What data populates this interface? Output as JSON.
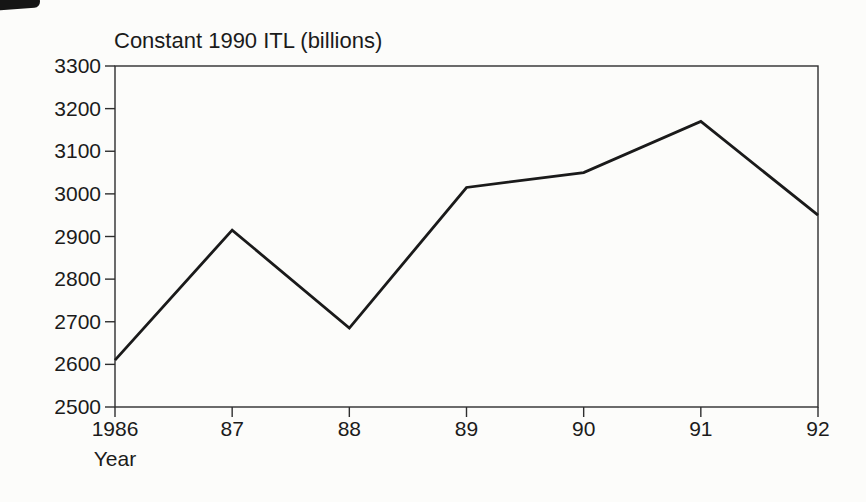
{
  "chart_data": {
    "type": "line",
    "title": "Constant 1990 ITL (billions)",
    "xlabel": "Year",
    "ylabel": "",
    "x": [
      1986,
      1987,
      1988,
      1989,
      1990,
      1991,
      1992
    ],
    "x_tick_labels": [
      "1986",
      "87",
      "88",
      "89",
      "90",
      "91",
      "92"
    ],
    "values": [
      2610,
      2915,
      2685,
      3015,
      3050,
      3170,
      2950
    ],
    "series_name": "Constant 1990 ITL (billions)",
    "ylim": [
      2500,
      3300
    ],
    "y_ticks": [
      2500,
      2600,
      2700,
      2800,
      2900,
      3000,
      3100,
      3200,
      3300
    ],
    "grid": false,
    "legend": "none",
    "line_color": "#1a1a1a",
    "frame_color": "#2e2e2e",
    "background_color": "#fcfcfa"
  }
}
